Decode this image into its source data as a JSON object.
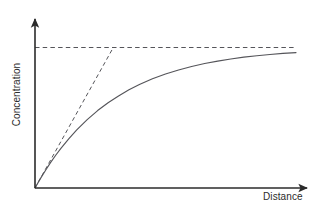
{
  "chart_data": {
    "type": "line",
    "title": "",
    "subtitle": "",
    "xlabel": "Distance",
    "ylabel": "Concentration",
    "xlim": [
      0,
      1
    ],
    "ylim": [
      0,
      1.12
    ],
    "grid": false,
    "legend": null,
    "axes_style": "arrow-tipped, no tick marks, no tick labels",
    "annotations": [
      {
        "name": "asymptote",
        "style": "dashed",
        "description": "Horizontal dashed line marking the maximum (plateau) concentration",
        "y": 1.0,
        "x_start": 0.0,
        "x_end": 1.0
      },
      {
        "name": "initial-tangent",
        "style": "dashed",
        "description": "Dashed tangent to the curve at the origin, meeting the asymptote at the characteristic distance",
        "x_start": 0.0,
        "y_start": 0.0,
        "x_end": 0.3,
        "y_end": 1.0
      }
    ],
    "series": [
      {
        "name": "Concentration profile",
        "style": "solid",
        "equation": "C = Cmax * (1 - exp(-x / 0.3))",
        "x": [
          0.0,
          0.02,
          0.04,
          0.06,
          0.08,
          0.1,
          0.13,
          0.16,
          0.2,
          0.24,
          0.28,
          0.32,
          0.36,
          0.4,
          0.45,
          0.5,
          0.55,
          0.6,
          0.65,
          0.7,
          0.75,
          0.8,
          0.85,
          0.9,
          0.95,
          1.0
        ],
        "values": [
          0.0,
          0.065,
          0.125,
          0.182,
          0.235,
          0.284,
          0.352,
          0.414,
          0.487,
          0.551,
          0.607,
          0.655,
          0.699,
          0.736,
          0.777,
          0.811,
          0.84,
          0.865,
          0.886,
          0.903,
          0.918,
          0.931,
          0.941,
          0.95,
          0.958,
          0.964
        ]
      }
    ]
  },
  "labels": {
    "x_axis": "Distance",
    "y_axis": "Concentration"
  },
  "colors": {
    "axis": "#2b2b2b",
    "curve": "#55555a",
    "dashed": "#55555a",
    "background": "#ffffff",
    "text": "#2b2b2b"
  },
  "icons": {
    "x_axis_arrow": "arrow-right-icon",
    "y_axis_arrow": "arrow-up-icon"
  }
}
